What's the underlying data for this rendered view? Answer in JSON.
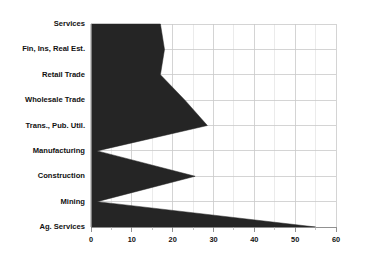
{
  "chart_data": {
    "type": "area",
    "orientation": "horizontal",
    "title": "",
    "subtitle": "",
    "xlabel": "",
    "ylabel": "",
    "categories": [
      "Services",
      "Fin, Ins, Real Est.",
      "Retail Trade",
      "Wholesale Trade",
      "Trans., Pub. Util.",
      "Manufacturing",
      "Construction",
      "Mining",
      "Ag. Services"
    ],
    "values": [
      17,
      18,
      17,
      23,
      28.5,
      1.5,
      25.5,
      1.5,
      55
    ],
    "series": [
      {
        "name": "",
        "values": [
          17,
          18,
          17,
          23,
          28.5,
          1.5,
          25.5,
          1.5,
          55
        ]
      }
    ],
    "xlim": [
      0,
      60
    ],
    "xticks": [
      0,
      10,
      20,
      30,
      40,
      50,
      60
    ],
    "xtick_labels": [
      "0",
      "10",
      "20",
      "30",
      "40",
      "50",
      "60"
    ],
    "x_minor_tick_step": 5,
    "grid": true,
    "grid_color": "#c9c9c9",
    "legend": false,
    "legend_position": "none",
    "fill_color": "#252525",
    "background_color": "#ffffff"
  }
}
